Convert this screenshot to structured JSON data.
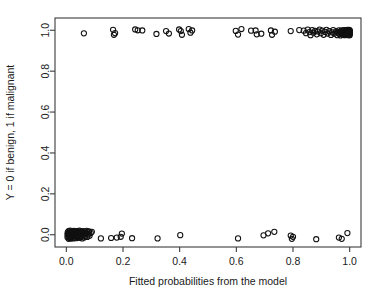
{
  "figure": {
    "background": "#ffffff",
    "frame_color": "#3b3b3b",
    "point_color": "#111111"
  },
  "chart_data": {
    "type": "scatter",
    "title": "",
    "xlabel": "Fitted probabilities from the model",
    "ylabel": "Y = 0 if benign, 1 if malignant",
    "xlim": [
      -0.04,
      1.04
    ],
    "ylim": [
      -0.06,
      1.06
    ],
    "xticks": [
      0.0,
      0.2,
      0.4,
      0.6,
      0.8,
      1.0
    ],
    "xtick_labels": [
      "0.0",
      "0.2",
      "0.4",
      "0.6",
      "0.8",
      "1.0"
    ],
    "yticks": [
      0.0,
      0.2,
      0.4,
      0.6,
      0.8,
      1.0
    ],
    "ytick_labels": [
      "0.0",
      "0.2",
      "0.4",
      "0.6",
      "0.8",
      "1.0"
    ],
    "grid": false,
    "legend": null,
    "marker": "open-circle",
    "marker_radius": 2.6,
    "series": [
      {
        "name": "Y = 1 (malignant)",
        "points": [
          [
            0.062,
            0.985
          ],
          [
            0.165,
            1.002
          ],
          [
            0.168,
            0.978
          ],
          [
            0.172,
            0.986
          ],
          [
            0.243,
            1.004
          ],
          [
            0.252,
            1.0
          ],
          [
            0.268,
            0.999
          ],
          [
            0.318,
            0.982
          ],
          [
            0.352,
            0.996
          ],
          [
            0.362,
            0.984
          ],
          [
            0.398,
            1.004
          ],
          [
            0.404,
            0.996
          ],
          [
            0.408,
            0.978
          ],
          [
            0.432,
            1.006
          ],
          [
            0.438,
            0.988
          ],
          [
            0.444,
            0.999
          ],
          [
            0.598,
            0.997
          ],
          [
            0.606,
            0.979
          ],
          [
            0.618,
            1.006
          ],
          [
            0.652,
            0.998
          ],
          [
            0.668,
            0.999
          ],
          [
            0.672,
            0.98
          ],
          [
            0.688,
            0.983
          ],
          [
            0.722,
            0.999
          ],
          [
            0.726,
            0.978
          ],
          [
            0.736,
            0.993
          ],
          [
            0.792,
            0.996
          ],
          [
            0.822,
            1.001
          ],
          [
            0.838,
            0.998
          ],
          [
            0.846,
            0.986
          ],
          [
            0.852,
            1.003
          ],
          [
            0.858,
            0.991
          ],
          [
            0.862,
            0.976
          ],
          [
            0.868,
            1.001
          ],
          [
            0.872,
            0.988
          ],
          [
            0.878,
            0.997
          ],
          [
            0.884,
            0.98
          ],
          [
            0.888,
            0.994
          ],
          [
            0.894,
            1.003
          ],
          [
            0.898,
            0.986
          ],
          [
            0.904,
            0.998
          ],
          [
            0.908,
            0.978
          ],
          [
            0.914,
            0.992
          ],
          [
            0.918,
            1.002
          ],
          [
            0.922,
            0.984
          ],
          [
            0.928,
            0.996
          ],
          [
            0.934,
            0.977
          ],
          [
            0.938,
            0.99
          ],
          [
            0.942,
            1.001
          ],
          [
            0.946,
            0.983
          ],
          [
            0.952,
            0.995
          ],
          [
            0.956,
            0.976
          ],
          [
            0.958,
            0.988
          ],
          [
            0.962,
            1.0
          ],
          [
            0.964,
            0.982
          ],
          [
            0.966,
            0.993
          ],
          [
            0.968,
            0.975
          ],
          [
            0.97,
            0.987
          ],
          [
            0.972,
            0.999
          ],
          [
            0.974,
            0.981
          ],
          [
            0.976,
            0.992
          ],
          [
            0.977,
            0.977
          ],
          [
            0.978,
            0.989
          ],
          [
            0.98,
            1.001
          ],
          [
            0.981,
            0.983
          ],
          [
            0.982,
            0.994
          ],
          [
            0.983,
            0.976
          ],
          [
            0.984,
            0.988
          ],
          [
            0.985,
            0.999
          ],
          [
            0.986,
            0.981
          ],
          [
            0.987,
            0.992
          ],
          [
            0.988,
            0.977
          ],
          [
            0.989,
            0.986
          ],
          [
            0.99,
            0.998
          ],
          [
            0.99,
            0.98
          ],
          [
            0.991,
            0.991
          ],
          [
            0.992,
            1.002
          ],
          [
            0.992,
            0.984
          ],
          [
            0.993,
            0.995
          ],
          [
            0.993,
            0.977
          ],
          [
            0.994,
            0.988
          ],
          [
            0.994,
            0.999
          ],
          [
            0.995,
            0.982
          ],
          [
            0.995,
            0.993
          ],
          [
            0.996,
            0.976
          ],
          [
            0.996,
            0.987
          ],
          [
            0.997,
            0.998
          ],
          [
            0.997,
            0.98
          ],
          [
            0.998,
            0.991
          ],
          [
            0.998,
            1.002
          ],
          [
            0.998,
            0.984
          ],
          [
            0.999,
            0.995
          ],
          [
            0.999,
            0.978
          ],
          [
            0.999,
            0.989
          ],
          [
            1.0,
            1.0
          ],
          [
            1.0,
            0.982
          ],
          [
            1.0,
            0.993
          ],
          [
            1.0,
            0.976
          ],
          [
            1.0,
            0.987
          ],
          [
            1.0,
            0.998
          ]
        ]
      },
      {
        "name": "Y = 0 (benign)",
        "points": [
          [
            0.004,
            0.002
          ],
          [
            0.004,
            -0.012
          ],
          [
            0.005,
            0.012
          ],
          [
            0.006,
            -0.004
          ],
          [
            0.007,
            0.006
          ],
          [
            0.008,
            -0.02
          ],
          [
            0.008,
            0.018
          ],
          [
            0.009,
            -0.009
          ],
          [
            0.01,
            0.002
          ],
          [
            0.011,
            -0.016
          ],
          [
            0.012,
            0.011
          ],
          [
            0.012,
            -0.002
          ],
          [
            0.013,
            0.02
          ],
          [
            0.014,
            -0.011
          ],
          [
            0.015,
            0.004
          ],
          [
            0.016,
            -0.019
          ],
          [
            0.016,
            0.014
          ],
          [
            0.017,
            -0.006
          ],
          [
            0.018,
            0.008
          ],
          [
            0.019,
            -0.014
          ],
          [
            0.02,
            0.017
          ],
          [
            0.021,
            0.0
          ],
          [
            0.022,
            -0.009
          ],
          [
            0.023,
            0.012
          ],
          [
            0.024,
            -0.018
          ],
          [
            0.025,
            0.006
          ],
          [
            0.026,
            0.019
          ],
          [
            0.027,
            -0.004
          ],
          [
            0.028,
            0.01
          ],
          [
            0.029,
            -0.013
          ],
          [
            0.03,
            0.002
          ],
          [
            0.031,
            0.016
          ],
          [
            0.032,
            -0.008
          ],
          [
            0.033,
            0.008
          ],
          [
            0.034,
            -0.017
          ],
          [
            0.035,
            0.014
          ],
          [
            0.036,
            -0.002
          ],
          [
            0.037,
            0.004
          ],
          [
            0.038,
            0.018
          ],
          [
            0.039,
            -0.011
          ],
          [
            0.04,
            0.009
          ],
          [
            0.041,
            -0.006
          ],
          [
            0.042,
            0.015
          ],
          [
            0.043,
            0.0
          ],
          [
            0.044,
            -0.015
          ],
          [
            0.045,
            0.011
          ],
          [
            0.046,
            0.02
          ],
          [
            0.047,
            -0.004
          ],
          [
            0.048,
            0.006
          ],
          [
            0.05,
            -0.012
          ],
          [
            0.051,
            0.016
          ],
          [
            0.052,
            0.002
          ],
          [
            0.053,
            -0.008
          ],
          [
            0.054,
            0.012
          ],
          [
            0.056,
            -0.018
          ],
          [
            0.057,
            0.008
          ],
          [
            0.058,
            0.018
          ],
          [
            0.06,
            -0.002
          ],
          [
            0.062,
            0.01
          ],
          [
            0.063,
            -0.013
          ],
          [
            0.065,
            0.004
          ],
          [
            0.066,
            0.015
          ],
          [
            0.068,
            -0.007
          ],
          [
            0.07,
            0.007
          ],
          [
            0.072,
            0.019
          ],
          [
            0.074,
            -0.011
          ],
          [
            0.076,
            0.012
          ],
          [
            0.078,
            0.002
          ],
          [
            0.08,
            0.016
          ],
          [
            0.082,
            -0.005
          ],
          [
            0.086,
            0.009
          ],
          [
            0.09,
            0.014
          ],
          [
            0.122,
            -0.018
          ],
          [
            0.158,
            -0.016
          ],
          [
            0.178,
            -0.014
          ],
          [
            0.192,
            -0.01
          ],
          [
            0.196,
            0.006
          ],
          [
            0.232,
            -0.017
          ],
          [
            0.322,
            -0.018
          ],
          [
            0.402,
            -0.002
          ],
          [
            0.606,
            -0.018
          ],
          [
            0.696,
            -0.003
          ],
          [
            0.712,
            0.007
          ],
          [
            0.734,
            0.014
          ],
          [
            0.792,
            -0.004
          ],
          [
            0.796,
            -0.02
          ],
          [
            0.8,
            -0.01
          ],
          [
            0.882,
            -0.022
          ],
          [
            0.962,
            -0.014
          ],
          [
            0.972,
            -0.02
          ],
          [
            0.992,
            0.008
          ]
        ]
      }
    ]
  },
  "plot_geometry": {
    "left": 55,
    "right": 361,
    "top": 18,
    "bottom": 247
  }
}
